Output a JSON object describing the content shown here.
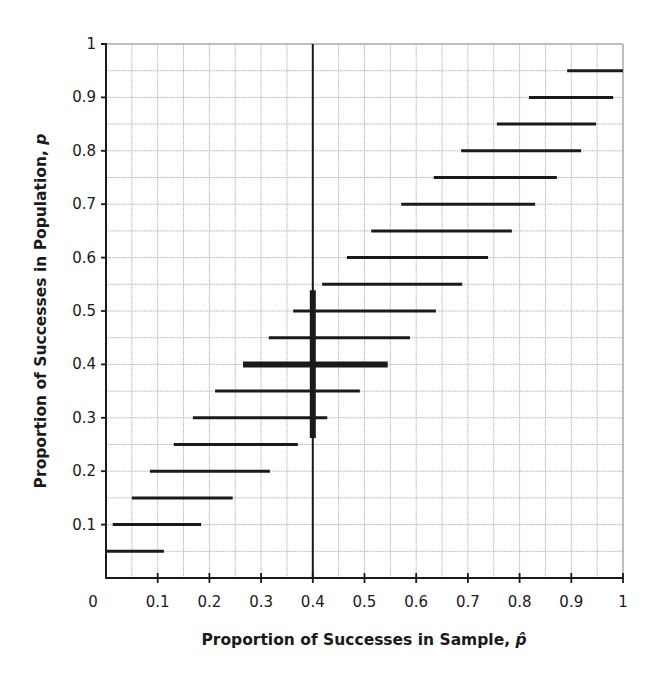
{
  "chart_data": {
    "type": "line",
    "subtype": "confidence-interval-chart",
    "title": "",
    "xlabel": "Proportion of Successes in Sample, p̂",
    "xlabel_main": "Proportion of Successes in Sample, ",
    "xlabel_symbol": "p̂",
    "ylabel": "Proportion of Successes in Population, p",
    "ylabel_main": "Proportion of Successes in Population, ",
    "ylabel_symbol": "p",
    "xlim": [
      0,
      1
    ],
    "ylim": [
      0,
      1
    ],
    "x_ticks": [
      "0",
      "0.1",
      "0.2",
      "0.3",
      "0.4",
      "0.5",
      "0.6",
      "0.7",
      "0.8",
      "0.9",
      "1"
    ],
    "y_ticks": [
      "0.1",
      "0.2",
      "0.3",
      "0.4",
      "0.5",
      "0.6",
      "0.7",
      "0.8",
      "0.9",
      "1"
    ],
    "grid": {
      "on": true,
      "step": 0.05
    },
    "legend": null,
    "intervals": [
      {
        "p": 0.05,
        "x_low": 0.0,
        "x_high": 0.112,
        "highlight": false
      },
      {
        "p": 0.1,
        "x_low": 0.013,
        "x_high": 0.184,
        "highlight": false
      },
      {
        "p": 0.15,
        "x_low": 0.05,
        "x_high": 0.245,
        "highlight": false
      },
      {
        "p": 0.2,
        "x_low": 0.085,
        "x_high": 0.317,
        "highlight": false
      },
      {
        "p": 0.25,
        "x_low": 0.131,
        "x_high": 0.371,
        "highlight": false
      },
      {
        "p": 0.3,
        "x_low": 0.168,
        "x_high": 0.428,
        "highlight": false
      },
      {
        "p": 0.35,
        "x_low": 0.211,
        "x_high": 0.491,
        "highlight": false
      },
      {
        "p": 0.4,
        "x_low": 0.265,
        "x_high": 0.545,
        "highlight": true
      },
      {
        "p": 0.45,
        "x_low": 0.315,
        "x_high": 0.588,
        "highlight": false
      },
      {
        "p": 0.5,
        "x_low": 0.362,
        "x_high": 0.638,
        "highlight": false
      },
      {
        "p": 0.55,
        "x_low": 0.418,
        "x_high": 0.689,
        "highlight": false
      },
      {
        "p": 0.6,
        "x_low": 0.466,
        "x_high": 0.739,
        "highlight": false
      },
      {
        "p": 0.65,
        "x_low": 0.513,
        "x_high": 0.785,
        "highlight": false
      },
      {
        "p": 0.7,
        "x_low": 0.571,
        "x_high": 0.83,
        "highlight": false
      },
      {
        "p": 0.75,
        "x_low": 0.634,
        "x_high": 0.872,
        "highlight": false
      },
      {
        "p": 0.8,
        "x_low": 0.687,
        "x_high": 0.919,
        "highlight": false
      },
      {
        "p": 0.85,
        "x_low": 0.756,
        "x_high": 0.948,
        "highlight": false
      },
      {
        "p": 0.9,
        "x_low": 0.818,
        "x_high": 0.981,
        "highlight": false
      },
      {
        "p": 0.95,
        "x_low": 0.892,
        "x_high": 1.0,
        "highlight": false
      }
    ],
    "reference_line": {
      "x": 0.4,
      "orientation": "vertical"
    },
    "highlighted_interval": {
      "x": 0.4,
      "p_low": 0.262,
      "p_high": 0.539
    }
  },
  "colors": {
    "background": "#ffffff",
    "grid": "#b8b8b8",
    "ink": "#1a1a1a"
  },
  "layout": {
    "plot_left": 106,
    "plot_right": 623,
    "plot_top": 44,
    "plot_bottom": 578
  }
}
